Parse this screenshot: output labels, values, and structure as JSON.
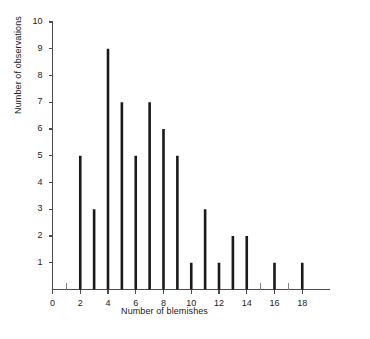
{
  "chart_data": {
    "type": "bar",
    "title": "",
    "subtitle": "",
    "xlabel": "Number of blemishes",
    "ylabel": "Number of observations",
    "categories": [
      0,
      1,
      2,
      3,
      4,
      5,
      6,
      7,
      8,
      9,
      10,
      11,
      12,
      13,
      14,
      15,
      16,
      17,
      18
    ],
    "values": [
      0,
      0,
      5,
      3,
      9,
      7,
      5,
      7,
      6,
      5,
      1,
      3,
      1,
      2,
      2,
      0,
      1,
      0,
      1
    ],
    "series": [
      {
        "name": "Number of observations",
        "values": [
          0,
          0,
          5,
          3,
          9,
          7,
          5,
          7,
          6,
          5,
          1,
          3,
          1,
          2,
          2,
          0,
          1,
          0,
          1
        ]
      }
    ],
    "points": [
      {
        "x": 2,
        "y": 5
      },
      {
        "x": 3,
        "y": 3
      },
      {
        "x": 4,
        "y": 9
      },
      {
        "x": 5,
        "y": 7
      },
      {
        "x": 6,
        "y": 5
      },
      {
        "x": 7,
        "y": 7
      },
      {
        "x": 8,
        "y": 6
      },
      {
        "x": 9,
        "y": 5
      },
      {
        "x": 10,
        "y": 1
      },
      {
        "x": 11,
        "y": 3
      },
      {
        "x": 12,
        "y": 1
      },
      {
        "x": 13,
        "y": 2
      },
      {
        "x": 14,
        "y": 2
      },
      {
        "x": 16,
        "y": 1
      },
      {
        "x": 18,
        "y": 1
      }
    ],
    "xlim": [
      0,
      20
    ],
    "ylim": [
      0,
      10
    ],
    "xticks": [
      0,
      2,
      4,
      6,
      8,
      10,
      12,
      14,
      16,
      18
    ],
    "xtick_labels": [
      "0",
      "2",
      "4",
      "6",
      "8",
      "10",
      "12",
      "14",
      "16",
      "18"
    ],
    "xminor_ticks": [
      1,
      3,
      5,
      7,
      9,
      11,
      13,
      15,
      17
    ],
    "yticks": [
      1,
      2,
      3,
      4,
      5,
      6,
      7,
      8,
      9,
      10
    ],
    "ytick_labels": [
      "1",
      "2",
      "3",
      "4",
      "5",
      "6",
      "7",
      "8",
      "9",
      "10"
    ],
    "grid": false,
    "legend": null,
    "bar_color": "#1a1a1a",
    "axis_color": "#4d4d4d",
    "background_color": "#ffffff"
  }
}
